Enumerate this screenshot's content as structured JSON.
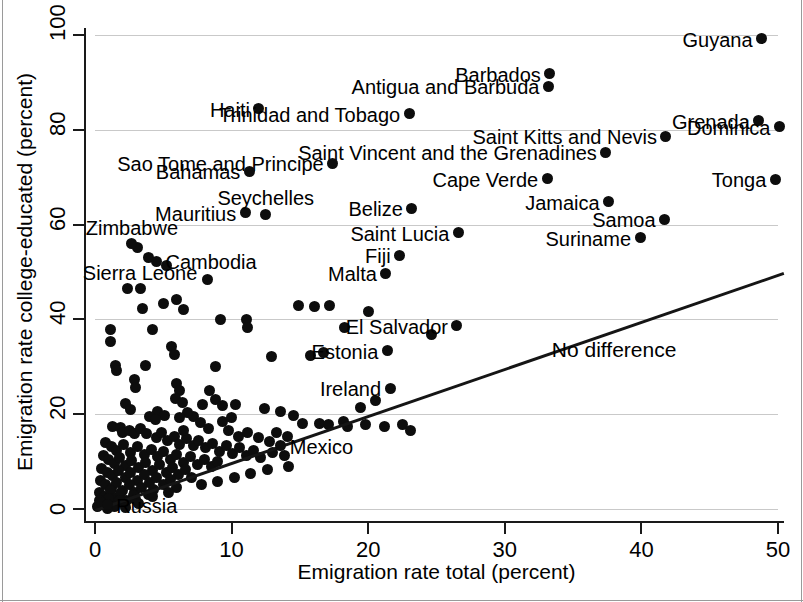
{
  "chart_data": {
    "type": "scatter",
    "title": "",
    "xlabel": "Emigration rate total (percent)",
    "ylabel": "Emigration rate college-educated (percent)",
    "xlim": [
      0,
      51.5
    ],
    "ylim": [
      0,
      103
    ],
    "xticks": [
      0,
      10,
      20,
      30,
      40,
      50
    ],
    "yticks": [
      0,
      20,
      40,
      60,
      80,
      100
    ],
    "grid": "horizontal",
    "legend": "none",
    "annotations": [
      {
        "text": "No difference",
        "x": 38.0,
        "y": 33.5
      }
    ],
    "reference_line": {
      "label": "No difference",
      "type": "identity",
      "x0": 0,
      "y0": 0,
      "x1": 50.4,
      "y1": 50.0
    },
    "labeled_points": [
      {
        "name": "Guyana",
        "x": 48.8,
        "y": 99.2,
        "label_side": "left"
      },
      {
        "name": "Barbados",
        "x": 33.3,
        "y": 91.8,
        "label_side": "left"
      },
      {
        "name": "Antigua and Barbuda",
        "x": 33.2,
        "y": 89.2,
        "label_side": "left"
      },
      {
        "name": "Haiti",
        "x": 12.0,
        "y": 84.4,
        "label_side": "left"
      },
      {
        "name": "Trinidad and Tobago",
        "x": 23.0,
        "y": 83.4,
        "label_side": "left"
      },
      {
        "name": "Grenada",
        "x": 48.6,
        "y": 81.9,
        "label_side": "left"
      },
      {
        "name": "Dominica",
        "x": 50.1,
        "y": 80.6,
        "label_side": "left"
      },
      {
        "name": "Saint Kitts and Nevis",
        "x": 41.8,
        "y": 78.6,
        "label_side": "left"
      },
      {
        "name": "Saint Vincent and the Grenadines",
        "x": 37.4,
        "y": 75.3,
        "label_side": "left"
      },
      {
        "name": "Sao Tome and Principe",
        "x": 17.4,
        "y": 72.9,
        "label_side": "left"
      },
      {
        "name": "Bahamas",
        "x": 11.3,
        "y": 71.3,
        "label_side": "left"
      },
      {
        "name": "Cape Verde",
        "x": 33.1,
        "y": 69.7,
        "label_side": "left"
      },
      {
        "name": "Tonga",
        "x": 49.8,
        "y": 69.6,
        "label_side": "left"
      },
      {
        "name": "Jamaica",
        "x": 37.6,
        "y": 64.8,
        "label_side": "left"
      },
      {
        "name": "Mauritius",
        "x": 11.0,
        "y": 62.5,
        "label_side": "left"
      },
      {
        "name": "Belize",
        "x": 23.2,
        "y": 63.4,
        "label_side": "left"
      },
      {
        "name": "Seychelles",
        "x": 12.5,
        "y": 62.2,
        "label_side": "above"
      },
      {
        "name": "Samoa",
        "x": 41.7,
        "y": 61.1,
        "label_side": "left"
      },
      {
        "name": "Saint Lucia",
        "x": 26.6,
        "y": 58.3,
        "label_side": "left"
      },
      {
        "name": "Suriname",
        "x": 39.9,
        "y": 57.2,
        "label_side": "left"
      },
      {
        "name": "Zimbabwe",
        "x": 2.7,
        "y": 56.0,
        "label_side": "above"
      },
      {
        "name": "Fiji",
        "x": 22.3,
        "y": 53.5,
        "label_side": "left"
      },
      {
        "name": "Cambodia",
        "x": 4.5,
        "y": 52.3,
        "label_side": "right"
      },
      {
        "name": "Malta",
        "x": 21.3,
        "y": 49.7,
        "label_side": "left"
      },
      {
        "name": "Sierra Leone",
        "x": 3.3,
        "y": 46.5,
        "label_side": "above"
      },
      {
        "name": "El Salvador",
        "x": 26.5,
        "y": 38.7,
        "label_side": "left"
      },
      {
        "name": "Estonia",
        "x": 21.4,
        "y": 33.4,
        "label_side": "left"
      },
      {
        "name": "Ireland",
        "x": 21.6,
        "y": 25.5,
        "label_side": "left"
      },
      {
        "name": "Mexico",
        "x": 13.6,
        "y": 13.3,
        "label_side": "right"
      },
      {
        "name": "Russia",
        "x": 0.9,
        "y": 0.9,
        "label_side": "right"
      }
    ],
    "unlabeled_points": [
      [
        3.1,
        55.1
      ],
      [
        3.9,
        53.1
      ],
      [
        5.2,
        51.4
      ],
      [
        8.2,
        48.4
      ],
      [
        2.4,
        46.6
      ],
      [
        6.0,
        44.3
      ],
      [
        5.0,
        43.4
      ],
      [
        3.5,
        42.3
      ],
      [
        6.5,
        42.0
      ],
      [
        14.9,
        43.0
      ],
      [
        16.1,
        42.7
      ],
      [
        17.2,
        42.9
      ],
      [
        20.0,
        41.6
      ],
      [
        9.2,
        40.0
      ],
      [
        11.1,
        40.0
      ],
      [
        11.2,
        38.3
      ],
      [
        18.3,
        38.3
      ],
      [
        1.1,
        37.9
      ],
      [
        4.2,
        37.8
      ],
      [
        24.6,
        36.8
      ],
      [
        1.1,
        35.4
      ],
      [
        5.6,
        34.2
      ],
      [
        5.8,
        32.5
      ],
      [
        12.9,
        32.1
      ],
      [
        15.8,
        32.4
      ],
      [
        16.7,
        33.0
      ],
      [
        1.5,
        30.2
      ],
      [
        1.6,
        29.2
      ],
      [
        3.7,
        30.2
      ],
      [
        2.9,
        27.4
      ],
      [
        3.0,
        25.6
      ],
      [
        6.0,
        26.4
      ],
      [
        6.2,
        25.1
      ],
      [
        5.9,
        23.3
      ],
      [
        6.4,
        22.5
      ],
      [
        8.4,
        25.0
      ],
      [
        8.8,
        23.0
      ],
      [
        7.9,
        22.0
      ],
      [
        9.3,
        21.8
      ],
      [
        4.6,
        20.5
      ],
      [
        5.1,
        19.8
      ],
      [
        10.3,
        22.1
      ],
      [
        12.4,
        21.2
      ],
      [
        13.6,
        20.6
      ],
      [
        14.5,
        19.7
      ],
      [
        19.4,
        21.5
      ],
      [
        20.5,
        22.9
      ],
      [
        15.2,
        18.0
      ],
      [
        16.4,
        18.0
      ],
      [
        17.1,
        17.9
      ],
      [
        18.2,
        18.4
      ],
      [
        18.5,
        17.4
      ],
      [
        19.8,
        17.9
      ],
      [
        1.3,
        17.5
      ],
      [
        1.9,
        17.2
      ],
      [
        2.0,
        16.2
      ],
      [
        2.5,
        16.6
      ],
      [
        2.9,
        15.9
      ],
      [
        3.3,
        17.0
      ],
      [
        3.8,
        16.0
      ],
      [
        4.5,
        15.0
      ],
      [
        4.9,
        16.2
      ],
      [
        5.3,
        14.4
      ],
      [
        5.8,
        15.3
      ],
      [
        6.2,
        13.6
      ],
      [
        6.7,
        14.9
      ],
      [
        7.2,
        13.3
      ],
      [
        7.6,
        14.4
      ],
      [
        8.1,
        12.9
      ],
      [
        8.6,
        13.8
      ],
      [
        9.1,
        12.2
      ],
      [
        9.6,
        13.4
      ],
      [
        10.1,
        11.8
      ],
      [
        10.6,
        12.9
      ],
      [
        11.1,
        11.3
      ],
      [
        11.6,
        12.4
      ],
      [
        12.1,
        10.8
      ],
      [
        0.8,
        14.0
      ],
      [
        1.2,
        13.2
      ],
      [
        1.6,
        12.4
      ],
      [
        2.1,
        13.6
      ],
      [
        2.6,
        12.0
      ],
      [
        3.1,
        13.1
      ],
      [
        3.6,
        11.5
      ],
      [
        4.1,
        12.6
      ],
      [
        4.6,
        11.0
      ],
      [
        5.0,
        12.1
      ],
      [
        5.5,
        10.4
      ],
      [
        6.0,
        11.6
      ],
      [
        6.5,
        9.9
      ],
      [
        7.0,
        11.0
      ],
      [
        7.5,
        9.4
      ],
      [
        8.0,
        10.5
      ],
      [
        8.5,
        8.9
      ],
      [
        9.0,
        10.0
      ],
      [
        0.6,
        11.2
      ],
      [
        1.0,
        10.4
      ],
      [
        1.4,
        9.6
      ],
      [
        1.8,
        10.8
      ],
      [
        2.2,
        9.2
      ],
      [
        2.7,
        10.3
      ],
      [
        3.2,
        8.7
      ],
      [
        3.7,
        9.8
      ],
      [
        4.2,
        8.2
      ],
      [
        4.7,
        9.3
      ],
      [
        5.2,
        7.7
      ],
      [
        5.7,
        8.8
      ],
      [
        6.1,
        7.2
      ],
      [
        6.6,
        8.3
      ],
      [
        7.1,
        6.7
      ],
      [
        0.5,
        8.6
      ],
      [
        0.9,
        7.8
      ],
      [
        1.3,
        7.0
      ],
      [
        1.7,
        8.2
      ],
      [
        2.2,
        6.6
      ],
      [
        2.6,
        7.7
      ],
      [
        3.1,
        6.1
      ],
      [
        3.6,
        7.2
      ],
      [
        4.0,
        5.6
      ],
      [
        4.5,
        6.7
      ],
      [
        5.0,
        5.1
      ],
      [
        5.5,
        6.2
      ],
      [
        6.0,
        4.6
      ],
      [
        0.4,
        6.0
      ],
      [
        0.8,
        5.2
      ],
      [
        1.2,
        4.4
      ],
      [
        1.6,
        5.6
      ],
      [
        2.0,
        4.0
      ],
      [
        2.5,
        5.1
      ],
      [
        2.9,
        3.5
      ],
      [
        3.4,
        4.6
      ],
      [
        3.9,
        3.0
      ],
      [
        4.3,
        4.1
      ],
      [
        0.3,
        3.4
      ],
      [
        0.7,
        2.6
      ],
      [
        1.1,
        3.8
      ],
      [
        1.5,
        2.2
      ],
      [
        1.9,
        3.3
      ],
      [
        2.3,
        1.7
      ],
      [
        2.8,
        2.8
      ],
      [
        3.2,
        1.2
      ],
      [
        0.3,
        1.8
      ],
      [
        0.6,
        1.0
      ],
      [
        1.0,
        2.2
      ],
      [
        1.4,
        0.6
      ],
      [
        1.8,
        1.7
      ],
      [
        2.2,
        0.4
      ],
      [
        0.2,
        0.5
      ],
      [
        0.5,
        1.4
      ],
      [
        0.9,
        0.2
      ],
      [
        7.2,
        19.5
      ],
      [
        7.7,
        18.2
      ],
      [
        8.3,
        16.9
      ],
      [
        9.8,
        16.5
      ],
      [
        10.5,
        15.4
      ],
      [
        11.2,
        16.1
      ],
      [
        12.0,
        15.0
      ],
      [
        12.8,
        14.2
      ],
      [
        13.3,
        16.2
      ],
      [
        14.1,
        15.3
      ],
      [
        9.3,
        18.5
      ],
      [
        10.0,
        19.2
      ],
      [
        6.8,
        20.3
      ],
      [
        6.2,
        19.2
      ],
      [
        21.2,
        17.5
      ],
      [
        22.5,
        17.8
      ],
      [
        23.1,
        16.5
      ],
      [
        8.8,
        30.1
      ],
      [
        2.2,
        22.2
      ],
      [
        2.6,
        21.0
      ],
      [
        4.0,
        19.6
      ],
      [
        4.4,
        18.8
      ],
      [
        13.0,
        12.0
      ],
      [
        13.9,
        11.2
      ],
      [
        6.5,
        16.5
      ],
      [
        14.2,
        9.0
      ],
      [
        12.6,
        8.3
      ],
      [
        11.4,
        7.5
      ],
      [
        10.2,
        6.7
      ],
      [
        9.0,
        5.9
      ],
      [
        7.8,
        5.1
      ],
      [
        5.4,
        3.5
      ],
      [
        4.2,
        2.7
      ],
      [
        3.0,
        1.9
      ]
    ]
  },
  "axis": {
    "x_title": "Emigration rate total (percent)",
    "y_title": "Emigration rate college-educated (percent)",
    "x_ticks": [
      "0",
      "10",
      "20",
      "30",
      "40",
      "50"
    ],
    "y_ticks": [
      "0",
      "20",
      "40",
      "60",
      "80",
      "100"
    ]
  },
  "colors": {
    "point": "#0d0d0d",
    "line": "#151515",
    "grid": "#c9c9c9",
    "axis": "#1a1a1a",
    "background": "#ffffff"
  }
}
